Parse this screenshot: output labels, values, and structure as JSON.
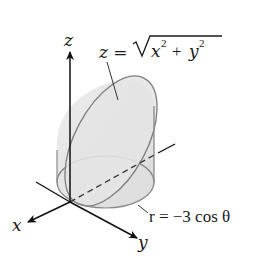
{
  "diagram": {
    "type": "3d-solid-region",
    "axes": {
      "x": {
        "label": "x"
      },
      "y": {
        "label": "y"
      },
      "z": {
        "label": "z"
      }
    },
    "labels": {
      "cone_eq_lhs": "z =",
      "cone_eq_radicand_x": "x",
      "cone_eq_plus": "+",
      "cone_eq_radicand_y": "y",
      "cone_eq_exp": "2",
      "cylinder_eq": "r = −3 cos θ"
    },
    "colors": {
      "surface_fill": "#e6e6e6",
      "surface_stroke": "#8a8a8a",
      "axis": "#111111"
    }
  }
}
